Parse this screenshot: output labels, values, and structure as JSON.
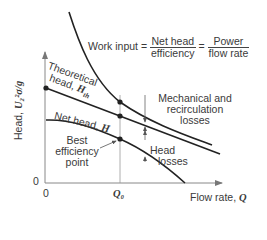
{
  "diagram": {
    "y_axis": {
      "label": "Head,",
      "expression": "U₂²σ/g",
      "origin_tick": "0"
    },
    "x_axis": {
      "label": "Flow rate,",
      "symbol": "Q",
      "origin_tick": "0",
      "marker_tick": "Q₀"
    },
    "curves": [
      {
        "name": "work-input",
        "label": "Work input"
      },
      {
        "name": "theoretical-head",
        "label_line1": "Theoretical",
        "label_line2": "head,",
        "symbol": "H",
        "subscript": "th"
      },
      {
        "name": "net-head",
        "label": "Net head,",
        "symbol": "H"
      }
    ],
    "equation": {
      "lhs": "Work input =",
      "frac1_num": "Net head",
      "frac1_den": "efficiency",
      "eq2": "=",
      "frac2_num": "Power",
      "frac2_den": "flow rate"
    },
    "annotations": {
      "mechanical_line1": "Mechanical and",
      "mechanical_line2": "recirculation",
      "mechanical_line3": "losses",
      "head_losses_line1": "Head",
      "head_losses_line2": "losses",
      "bep_line1": "Best",
      "bep_line2": "efficiency",
      "bep_line3": "point"
    },
    "colors": {
      "curve": "#222222",
      "axis": "#888888",
      "text": "#3a3a3a"
    }
  }
}
